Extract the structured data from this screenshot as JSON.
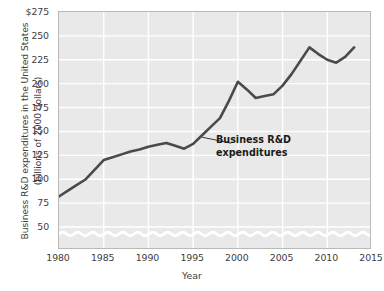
{
  "chart_data": {
    "type": "line",
    "title": "",
    "xlabel": "Year",
    "ylabel": "Business R&D expenditures in the United States\n(billions of 2000 dollars)",
    "ylabel_line1": "Business R&D expenditures in the United States",
    "ylabel_line2": "(billions of 2000 dollars)",
    "xlim": [
      1980,
      2015
    ],
    "ylim": [
      38,
      275
    ],
    "y_axis_broken": true,
    "grid": true,
    "legend": "none",
    "xticks": [
      1980,
      1985,
      1990,
      1995,
      2000,
      2005,
      2010,
      2015
    ],
    "xtick_labels": [
      "1980",
      "1985",
      "1990",
      "1995",
      "2000",
      "2005",
      "2010",
      "2015"
    ],
    "yticks": [
      50,
      75,
      100,
      125,
      150,
      175,
      200,
      225,
      250,
      275
    ],
    "ytick_labels": [
      "50",
      "75",
      "100",
      "125",
      "150",
      "175",
      "200",
      "225",
      "250",
      "$275"
    ],
    "series": [
      {
        "name": "Business R&D expenditures",
        "color": "#4a4a4a",
        "x": [
          1980,
          1981,
          1982,
          1983,
          1984,
          1985,
          1986,
          1987,
          1988,
          1989,
          1990,
          1991,
          1992,
          1993,
          1994,
          1995,
          1996,
          1997,
          1998,
          1999,
          2000,
          2001,
          2002,
          2003,
          2004,
          2005,
          2006,
          2007,
          2008,
          2009,
          2010,
          2011,
          2012,
          2013
        ],
        "values": [
          82,
          88,
          94,
          100,
          110,
          120,
          123,
          126,
          129,
          131,
          134,
          136,
          138,
          135,
          132,
          137,
          146,
          155,
          164,
          182,
          202,
          194,
          185,
          187,
          189,
          198,
          210,
          224,
          238,
          231,
          225,
          222,
          228,
          238
        ]
      }
    ],
    "annotations": [
      {
        "text": "Business R&D\nexpenditures",
        "line1": "Business R&D",
        "line2": "expenditures",
        "pointer_from_year": 1996,
        "pointer_from_value": 144
      }
    ],
    "colors": {
      "plot_background": "#e9e9e9",
      "grid": "#ffffff",
      "line": "#4a4a4a",
      "text": "#3d3d3d",
      "border": "#b9b9b9",
      "page_background": "#ffffff"
    }
  }
}
